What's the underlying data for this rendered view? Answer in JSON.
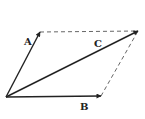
{
  "diagram": {
    "type": "vector-parallelogram",
    "origin": {
      "x": 6,
      "y": 97
    },
    "vectors": [
      {
        "id": "A",
        "label": "A",
        "tip": {
          "x": 40,
          "y": 32
        },
        "label_pos": {
          "x": 24,
          "y": 45
        }
      },
      {
        "id": "B",
        "label": "B",
        "tip": {
          "x": 101,
          "y": 96
        },
        "label_pos": {
          "x": 80,
          "y": 110
        }
      },
      {
        "id": "C",
        "label": "C",
        "tip": {
          "x": 138,
          "y": 31
        },
        "label_pos": {
          "x": 94,
          "y": 47
        }
      }
    ],
    "dashed_edges": [
      {
        "from": "A",
        "to": "C"
      },
      {
        "from": "B",
        "to": "C"
      }
    ],
    "colors": {
      "stroke": "#222222",
      "dashed": "#555555",
      "background": "#ffffff"
    }
  }
}
